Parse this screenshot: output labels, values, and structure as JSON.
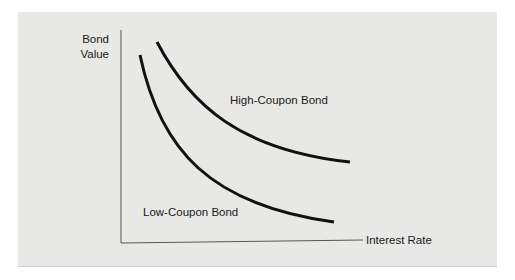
{
  "diagram": {
    "y_axis_label_line1": "Bond",
    "y_axis_label_line2": "Value",
    "x_axis_label": "Interest Rate",
    "curves": [
      {
        "name": "High-Coupon Bond",
        "label": "High-Coupon Bond"
      },
      {
        "name": "Low-Coupon Bond",
        "label": "Low-Coupon Bond"
      }
    ],
    "colors": {
      "panel_background": "#e8e8e6",
      "curve": "#111111",
      "axis": "#555555"
    }
  }
}
